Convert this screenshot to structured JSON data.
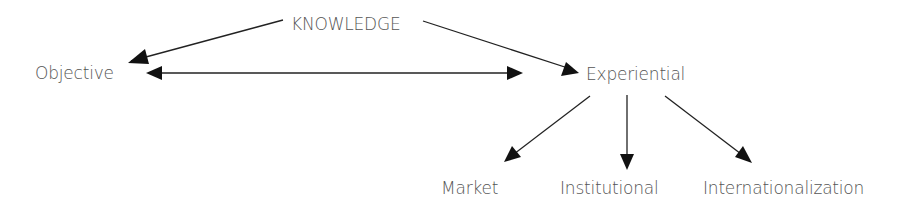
{
  "diagram": {
    "root": {
      "label": "KNOWLEDGE"
    },
    "level1": [
      {
        "label": "Objective"
      },
      {
        "label": "Experiential"
      }
    ],
    "level2": [
      {
        "label": "Market"
      },
      {
        "label": "Institutional"
      },
      {
        "label": "Internationalization"
      }
    ],
    "edges": [
      {
        "from": "KNOWLEDGE",
        "to": "Objective",
        "type": "arrow"
      },
      {
        "from": "KNOWLEDGE",
        "to": "Experiential",
        "type": "arrow"
      },
      {
        "from": "Objective",
        "to": "Experiential",
        "type": "double-arrow"
      },
      {
        "from": "Experiential",
        "to": "Market",
        "type": "arrow"
      },
      {
        "from": "Experiential",
        "to": "Institutional",
        "type": "arrow"
      },
      {
        "from": "Experiential",
        "to": "Internationalization",
        "type": "arrow"
      }
    ],
    "colors": {
      "line": "#222222",
      "text": "#555555"
    }
  }
}
